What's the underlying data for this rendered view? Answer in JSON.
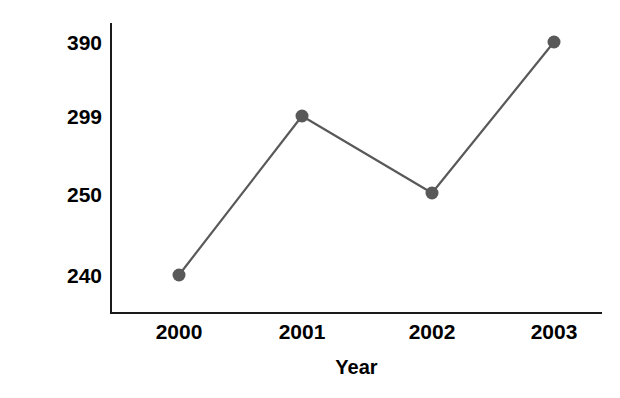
{
  "chart_data": {
    "type": "line",
    "title": "",
    "xlabel": "Year",
    "ylabel": "Number of Students Voting",
    "categories": [
      "2000",
      "2001",
      "2002",
      "2003"
    ],
    "values": [
      240,
      299,
      250,
      390
    ],
    "x_tick_labels": [
      "2000",
      "2001",
      "2002",
      "2003"
    ],
    "y_tick_labels": [
      "240",
      "250",
      "299",
      "390"
    ],
    "y_tick_values": [
      240,
      250,
      299,
      390
    ],
    "grid": false,
    "legend": false,
    "series": [
      {
        "name": "Number of Students Voting",
        "values": [
          240,
          299,
          250,
          390
        ]
      }
    ],
    "points": [
      {
        "category": "2000",
        "value": 240,
        "px": 179,
        "py": 275
      },
      {
        "category": "2001",
        "value": 299,
        "px": 302,
        "py": 116
      },
      {
        "category": "2002",
        "value": 250,
        "px": 432,
        "py": 193
      },
      {
        "category": "2003",
        "value": 390,
        "px": 554,
        "py": 42
      }
    ],
    "colors": {
      "line": "#595959",
      "marker": "#595959",
      "axis": "#1a1a1a",
      "text": "#000000",
      "background": "#ffffff"
    },
    "axes": {
      "x_spine_y": 313,
      "x_spine_left": 111,
      "x_spine_right": 602,
      "y_spine_x": 111,
      "y_spine_top": 23,
      "y_spine_bottom": 313
    },
    "style": {
      "line_width": 2.2,
      "marker_radius": 6.5,
      "marker_shape": "circle"
    }
  }
}
